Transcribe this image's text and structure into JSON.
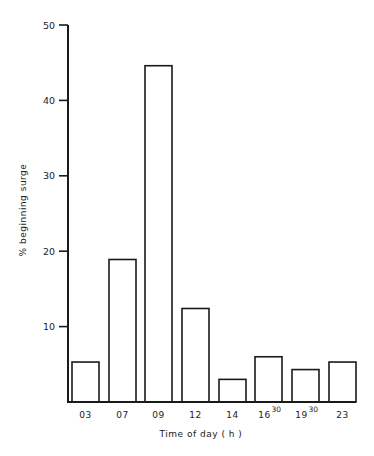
{
  "chart_data": {
    "type": "bar",
    "title": "",
    "xlabel": "Time of day ( h )",
    "ylabel": "% beginning surge",
    "ylim": [
      0,
      50
    ],
    "yticks": [
      10,
      20,
      30,
      40,
      50
    ],
    "grid": false,
    "legend": null,
    "categories": [
      {
        "main": "03",
        "sup": ""
      },
      {
        "main": "07",
        "sup": ""
      },
      {
        "main": "09",
        "sup": ""
      },
      {
        "main": "12",
        "sup": ""
      },
      {
        "main": "14",
        "sup": ""
      },
      {
        "main": "16",
        "sup": "30"
      },
      {
        "main": "19",
        "sup": "30"
      },
      {
        "main": "23",
        "sup": ""
      }
    ],
    "category_labels": [
      "03",
      "07",
      "09",
      "12",
      "14",
      "16:30",
      "19:30",
      "23"
    ],
    "values": [
      5.3,
      18.9,
      44.6,
      12.4,
      3.0,
      6.0,
      4.3,
      5.3
    ],
    "colors": {
      "bar_fill": "#ffffff",
      "bar_stroke": "#1a1a1a",
      "axis": "#1a1a1a"
    }
  }
}
